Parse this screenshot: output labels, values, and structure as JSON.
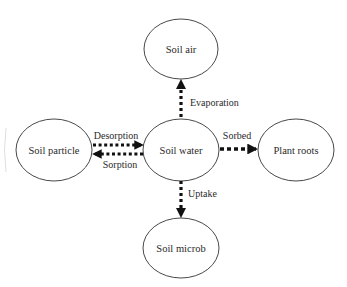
{
  "diagram": {
    "type": "flow",
    "nodes": [
      {
        "id": "soil_air",
        "label": "Soil air"
      },
      {
        "id": "soil_particle",
        "label": "Soil particle"
      },
      {
        "id": "soil_water",
        "label": "Soil water"
      },
      {
        "id": "plant_roots",
        "label": "Plant roots"
      },
      {
        "id": "soil_microb",
        "label": "Soil microb"
      }
    ],
    "edges": [
      {
        "from": "soil_water",
        "to": "soil_air",
        "label": "Evaporation"
      },
      {
        "from": "soil_particle",
        "to": "soil_water",
        "label": "Desorption"
      },
      {
        "from": "soil_water",
        "to": "soil_particle",
        "label": "Sorption"
      },
      {
        "from": "soil_water",
        "to": "plant_roots",
        "label": "Sorbed"
      },
      {
        "from": "soil_water",
        "to": "soil_microb",
        "label": "Uptake"
      }
    ],
    "colors": {
      "stroke": "#222222",
      "arrow": "#111111",
      "background": "#ffffff"
    }
  }
}
